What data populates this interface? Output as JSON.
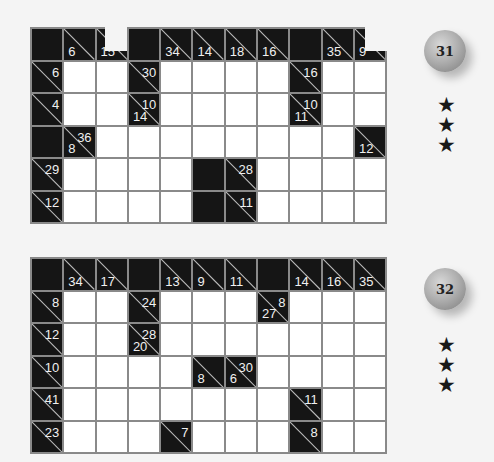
{
  "puzzles": [
    {
      "number": "31",
      "stars": [
        "★",
        "★",
        "★"
      ],
      "rows": [
        [
          {
            "t": "b"
          },
          {
            "t": "c",
            "d": "6"
          },
          {
            "t": "c",
            "d": "15"
          },
          {
            "t": "b"
          },
          {
            "t": "c",
            "d": "34"
          },
          {
            "t": "c",
            "d": "14"
          },
          {
            "t": "c",
            "d": "18"
          },
          {
            "t": "c",
            "d": "16"
          },
          {
            "t": "b"
          },
          {
            "t": "c",
            "d": "35"
          },
          {
            "t": "c",
            "d": "9"
          }
        ],
        [
          {
            "t": "c",
            "r": "6"
          },
          {
            "t": "w"
          },
          {
            "t": "w"
          },
          {
            "t": "c",
            "r": "30"
          },
          {
            "t": "w"
          },
          {
            "t": "w"
          },
          {
            "t": "w"
          },
          {
            "t": "w"
          },
          {
            "t": "c",
            "r": "16"
          },
          {
            "t": "w"
          },
          {
            "t": "w"
          }
        ],
        [
          {
            "t": "c",
            "r": "4"
          },
          {
            "t": "w"
          },
          {
            "t": "w"
          },
          {
            "t": "c",
            "r": "10",
            "d": "14"
          },
          {
            "t": "w"
          },
          {
            "t": "w"
          },
          {
            "t": "w"
          },
          {
            "t": "w"
          },
          {
            "t": "c",
            "r": "10",
            "d": "11"
          },
          {
            "t": "w"
          },
          {
            "t": "w"
          }
        ],
        [
          {
            "t": "b"
          },
          {
            "t": "c",
            "r": "36",
            "d": "8"
          },
          {
            "t": "w"
          },
          {
            "t": "w"
          },
          {
            "t": "w"
          },
          {
            "t": "w"
          },
          {
            "t": "w"
          },
          {
            "t": "w"
          },
          {
            "t": "w"
          },
          {
            "t": "w"
          },
          {
            "t": "c",
            "d": "12"
          }
        ],
        [
          {
            "t": "c",
            "r": "29"
          },
          {
            "t": "w"
          },
          {
            "t": "w"
          },
          {
            "t": "w"
          },
          {
            "t": "w"
          },
          {
            "t": "b"
          },
          {
            "t": "c",
            "r": "28"
          },
          {
            "t": "w"
          },
          {
            "t": "w"
          },
          {
            "t": "w"
          },
          {
            "t": "w"
          }
        ],
        [
          {
            "t": "c",
            "r": "12"
          },
          {
            "t": "w"
          },
          {
            "t": "w"
          },
          {
            "t": "w"
          },
          {
            "t": "w"
          },
          {
            "t": "b"
          },
          {
            "t": "c",
            "r": "11"
          },
          {
            "t": "w"
          },
          {
            "t": "w"
          },
          {
            "t": "w"
          },
          {
            "t": "w"
          }
        ]
      ]
    },
    {
      "number": "32",
      "stars": [
        "★",
        "★",
        "★"
      ],
      "rows": [
        [
          {
            "t": "b"
          },
          {
            "t": "c",
            "d": "34"
          },
          {
            "t": "c",
            "d": "17"
          },
          {
            "t": "b"
          },
          {
            "t": "c",
            "d": "13"
          },
          {
            "t": "c",
            "d": "9"
          },
          {
            "t": "c",
            "d": "11"
          },
          {
            "t": "b"
          },
          {
            "t": "c",
            "d": "14"
          },
          {
            "t": "c",
            "d": "16"
          },
          {
            "t": "c",
            "d": "35"
          }
        ],
        [
          {
            "t": "c",
            "r": "8"
          },
          {
            "t": "w"
          },
          {
            "t": "w"
          },
          {
            "t": "c",
            "r": "24"
          },
          {
            "t": "w"
          },
          {
            "t": "w"
          },
          {
            "t": "w"
          },
          {
            "t": "c",
            "r": "8",
            "d": "27"
          },
          {
            "t": "w"
          },
          {
            "t": "w"
          },
          {
            "t": "w"
          }
        ],
        [
          {
            "t": "c",
            "r": "12"
          },
          {
            "t": "w"
          },
          {
            "t": "w"
          },
          {
            "t": "c",
            "r": "28",
            "d": "20"
          },
          {
            "t": "w"
          },
          {
            "t": "w"
          },
          {
            "t": "w"
          },
          {
            "t": "w"
          },
          {
            "t": "w"
          },
          {
            "t": "w"
          },
          {
            "t": "w"
          }
        ],
        [
          {
            "t": "c",
            "r": "10"
          },
          {
            "t": "w"
          },
          {
            "t": "w"
          },
          {
            "t": "w"
          },
          {
            "t": "w"
          },
          {
            "t": "c",
            "d": "8"
          },
          {
            "t": "c",
            "r": "30",
            "d": "6"
          },
          {
            "t": "w"
          },
          {
            "t": "w"
          },
          {
            "t": "w"
          },
          {
            "t": "w"
          }
        ],
        [
          {
            "t": "c",
            "r": "41"
          },
          {
            "t": "w"
          },
          {
            "t": "w"
          },
          {
            "t": "w"
          },
          {
            "t": "w"
          },
          {
            "t": "w"
          },
          {
            "t": "w"
          },
          {
            "t": "w"
          },
          {
            "t": "c",
            "r": "11"
          },
          {
            "t": "w"
          },
          {
            "t": "w"
          }
        ],
        [
          {
            "t": "c",
            "r": "23"
          },
          {
            "t": "w"
          },
          {
            "t": "w"
          },
          {
            "t": "w"
          },
          {
            "t": "c",
            "r": "7"
          },
          {
            "t": "w"
          },
          {
            "t": "w"
          },
          {
            "t": "w"
          },
          {
            "t": "c",
            "r": "8"
          },
          {
            "t": "w"
          },
          {
            "t": "w"
          }
        ]
      ]
    }
  ]
}
